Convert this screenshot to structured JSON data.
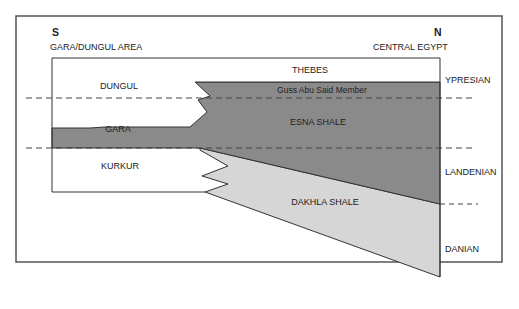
{
  "diagram": {
    "left_end": {
      "direction": "S",
      "area": "GARA/DUNGUL AREA"
    },
    "right_end": {
      "direction": "N",
      "area": "CENTRAL EGYPT"
    },
    "formations": {
      "thebes": "THEBES",
      "guss_abu_said": "Guss Abu Said Member",
      "esna": "ESNA SHALE",
      "dungul": "DUNGUL",
      "gara": "GARA",
      "kurkur": "KURKUR",
      "dakhla": "DAKHLA SHALE"
    },
    "stages": {
      "ypresian": "YPRESIAN",
      "landenian": "LANDENIAN",
      "danian": "DANIAN"
    },
    "colors": {
      "background": "#ffffff",
      "frame": "#555555",
      "esna_dark_gray": "#8a8a8a",
      "dakhla_light_gray": "#d6d6d6",
      "outline": "#333333",
      "dashed": "#444444"
    }
  }
}
